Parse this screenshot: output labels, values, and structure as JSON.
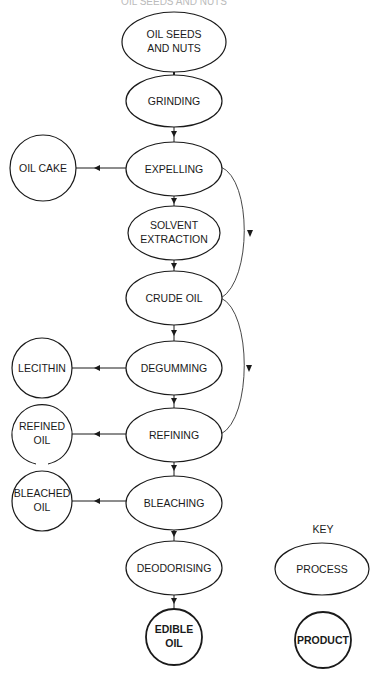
{
  "diagram": {
    "title_partial": "OIL SEEDS AND NUTS",
    "processes": [
      {
        "id": "oil-seeds",
        "lines": [
          "OIL SEEDS",
          "AND NUTS"
        ]
      },
      {
        "id": "grinding",
        "lines": [
          "GRINDING"
        ]
      },
      {
        "id": "expelling",
        "lines": [
          "EXPELLING"
        ]
      },
      {
        "id": "solvent-extraction",
        "lines": [
          "SOLVENT",
          "EXTRACTION"
        ]
      },
      {
        "id": "crude-oil",
        "lines": [
          "CRUDE OIL"
        ]
      },
      {
        "id": "degumming",
        "lines": [
          "DEGUMMING"
        ]
      },
      {
        "id": "refining",
        "lines": [
          "REFINING"
        ]
      },
      {
        "id": "bleaching",
        "lines": [
          "BLEACHING"
        ]
      },
      {
        "id": "deodorising",
        "lines": [
          "DEODORISING"
        ]
      }
    ],
    "products": [
      {
        "id": "oil-cake",
        "lines": [
          "OIL CAKE"
        ],
        "from": "expelling"
      },
      {
        "id": "lecithin",
        "lines": [
          "LECITHIN"
        ],
        "from": "degumming"
      },
      {
        "id": "refined-oil",
        "lines": [
          "REFINED",
          "OIL"
        ],
        "from": "refining"
      },
      {
        "id": "bleached-oil",
        "lines": [
          "BLEACHED",
          "OIL"
        ],
        "from": "bleaching"
      },
      {
        "id": "edible-oil",
        "lines": [
          "EDIBLE",
          "OIL"
        ],
        "from": "deodorising"
      }
    ],
    "bypass_edges": [
      {
        "from": "expelling",
        "to": "crude-oil"
      },
      {
        "from": "crude-oil",
        "to": "refining"
      }
    ],
    "key": {
      "title": "KEY",
      "process_label": "PROCESS",
      "product_label": "PRODUCT"
    }
  }
}
